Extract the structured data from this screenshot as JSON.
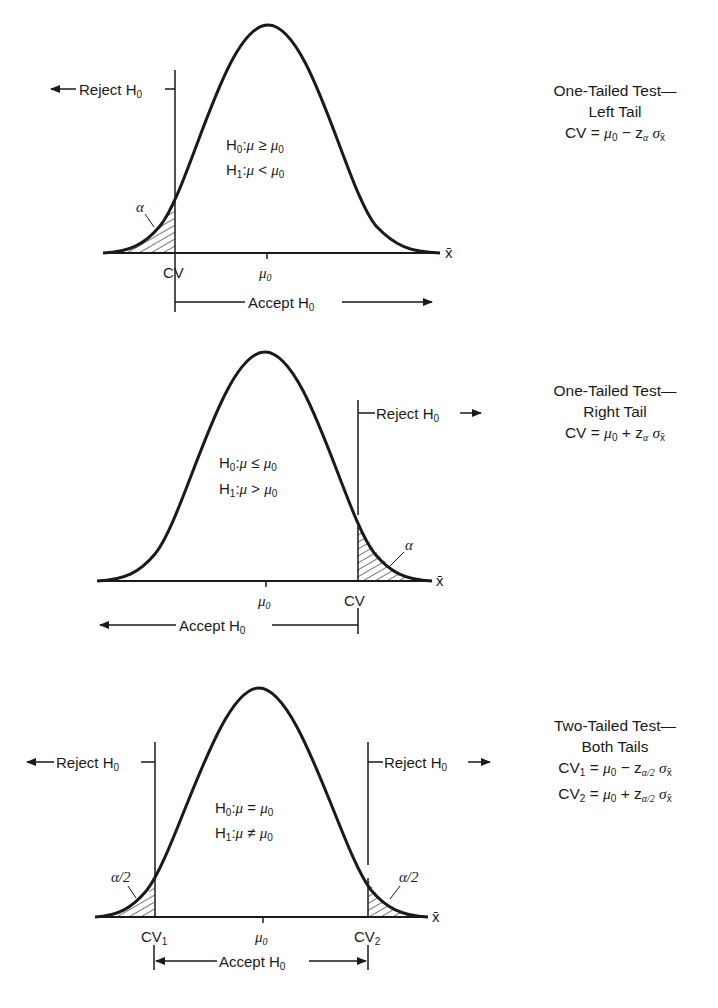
{
  "panels": [
    {
      "id": "left-tail",
      "title_line1": "One-Tailed Test—",
      "title_line2": "Left Tail",
      "formula_lines": [
        "CV = μ₀ − zα σx̄"
      ],
      "hypothesis_h0": "H₀:μ ≥ μ₀",
      "hypothesis_h1": "H₁:μ < μ₀",
      "reject_label": "Reject H₀",
      "accept_label": "Accept H₀",
      "cv_labels": [
        "CV"
      ],
      "mean_label": "μ₀",
      "axis_label": "x̄",
      "tail_labels": [
        "α"
      ]
    },
    {
      "id": "right-tail",
      "title_line1": "One-Tailed Test—",
      "title_line2": "Right Tail",
      "formula_lines": [
        "CV = μ₀ + zα σx̄"
      ],
      "hypothesis_h0": "H₀:μ ≤ μ₀",
      "hypothesis_h1": "H₁:μ > μ₀",
      "reject_label": "Reject H₀",
      "accept_label": "Accept H₀",
      "cv_labels": [
        "CV"
      ],
      "mean_label": "μ₀",
      "axis_label": "x̄",
      "tail_labels": [
        "α"
      ]
    },
    {
      "id": "two-tail",
      "title_line1": "Two-Tailed Test—",
      "title_line2": "Both Tails",
      "formula_lines": [
        "CV₁ = μ₀ − zα/2 σx̄",
        "CV₂ = μ₀ + zα/2 σx̄"
      ],
      "hypothesis_h0": "H₀:μ = μ₀",
      "hypothesis_h1": "H₁:μ ≠ μ₀",
      "reject_label": "Reject H₀",
      "accept_label": "Accept H₀",
      "cv_labels": [
        "CV₁",
        "CV₂"
      ],
      "mean_label": "μ₀",
      "axis_label": "x̄",
      "tail_labels": [
        "α/2",
        "α/2"
      ]
    }
  ],
  "text": {
    "H": "H",
    "sub0": "0",
    "sub1": "1",
    "sub2": "2",
    "mu": "μ",
    "alpha": "α",
    "alpha_half": "α/2",
    "sigma": "σ",
    "xbar": "x̄",
    "z": "z",
    "CV": "CV",
    "reject": "Reject H",
    "accept": "Accept H",
    "ge": " ≥ ",
    "le": " ≤ ",
    "lt": " < ",
    "gt": " > ",
    "eq": " = ",
    "ne": " ≠ ",
    "colon": ":",
    "p1_t1": "One-Tailed Test—",
    "p1_t2": "Left Tail",
    "p2_t1": "One-Tailed Test—",
    "p2_t2": "Right Tail",
    "p3_t1": "Two-Tailed Test—",
    "p3_t2": "Both Tails",
    "cv_eq": "CV = ",
    "minus": " − ",
    "plus": " + ",
    "a2": "α/2"
  },
  "colors": {
    "ink": "#1a1a1a",
    "background": "#ffffff"
  }
}
